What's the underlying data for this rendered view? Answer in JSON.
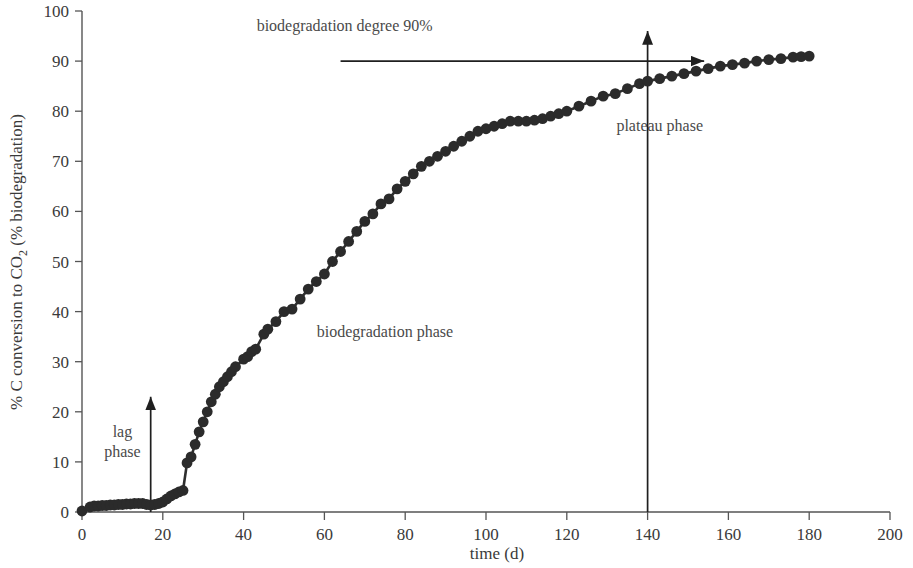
{
  "chart_data": {
    "type": "line",
    "title": "",
    "xlabel": "time (d)",
    "ylabel": "% C conversion to CO2 (% biodegradation)",
    "ylabel_parts": {
      "pre": "% C conversion to CO",
      "sub": "2",
      "post": " (% biodegradation)"
    },
    "xlim": [
      0,
      200
    ],
    "ylim": [
      0,
      100
    ],
    "xticks": [
      0,
      20,
      40,
      60,
      80,
      100,
      120,
      140,
      160,
      180,
      200
    ],
    "yticks": [
      0,
      10,
      20,
      30,
      40,
      50,
      60,
      70,
      80,
      90,
      100
    ],
    "grid": false,
    "legend": null,
    "marker": "filled-circle",
    "series": [
      {
        "name": "biodegradation curve",
        "x": [
          0,
          2,
          3,
          4,
          5,
          6,
          7,
          8,
          9,
          10,
          11,
          12,
          13,
          14,
          15,
          16,
          17,
          18,
          19,
          20,
          21,
          22,
          23,
          24,
          25,
          26,
          27,
          28,
          29,
          30,
          31,
          32,
          33,
          34,
          35,
          36,
          37,
          38,
          40,
          41,
          42,
          43,
          45,
          46,
          48,
          50,
          52,
          54,
          56,
          58,
          60,
          62,
          64,
          66,
          68,
          70,
          72,
          74,
          76,
          78,
          80,
          82,
          84,
          86,
          88,
          90,
          92,
          94,
          96,
          98,
          100,
          102,
          104,
          106,
          108,
          110,
          112,
          114,
          116,
          118,
          120,
          123,
          126,
          129,
          132,
          135,
          138,
          140,
          143,
          146,
          149,
          152,
          155,
          158,
          161,
          164,
          167,
          170,
          173,
          176,
          178,
          180
        ],
        "y": [
          0.2,
          1.0,
          1.2,
          1.2,
          1.3,
          1.3,
          1.4,
          1.4,
          1.5,
          1.5,
          1.6,
          1.6,
          1.7,
          1.7,
          1.7,
          1.5,
          1.4,
          1.5,
          1.7,
          2.0,
          2.6,
          3.2,
          3.6,
          4.0,
          4.3,
          9.8,
          11.0,
          13.5,
          16.0,
          18.0,
          20.0,
          22.0,
          23.5,
          25.0,
          26.0,
          27.0,
          28.0,
          29.0,
          30.5,
          31.0,
          32.0,
          32.5,
          35.5,
          36.5,
          38.0,
          40.0,
          40.5,
          42.5,
          44.5,
          46.0,
          47.5,
          50.0,
          52.0,
          54.0,
          56.0,
          58.0,
          59.5,
          61.5,
          62.5,
          64.5,
          66.0,
          67.5,
          69.0,
          70.0,
          71.0,
          72.0,
          73.0,
          74.0,
          75.0,
          76.0,
          76.5,
          77.0,
          77.5,
          78.0,
          78.0,
          78.0,
          78.2,
          78.5,
          79.0,
          79.5,
          80.0,
          81.0,
          82.0,
          83.0,
          83.5,
          84.5,
          85.5,
          86.0,
          86.5,
          87.0,
          87.5,
          88.0,
          88.5,
          89.0,
          89.3,
          89.6,
          90.0,
          90.3,
          90.5,
          90.8,
          90.9,
          91.0
        ]
      }
    ],
    "annotations": [
      {
        "id": "biodeg-degree",
        "text": "biodegradation degree 90%",
        "x": 65,
        "y": 96,
        "kind": "text"
      },
      {
        "id": "lag-phase",
        "text": "lag phase",
        "lines": [
          "lag",
          "phase"
        ],
        "x": 10,
        "y": 15,
        "kind": "text"
      },
      {
        "id": "biodeg-phase",
        "text": "biodegradation phase",
        "x": 75,
        "y": 35,
        "kind": "text"
      },
      {
        "id": "plateau-phase",
        "text": "plateau phase",
        "x": 143,
        "y": 76,
        "kind": "text"
      },
      {
        "id": "level-90-arrow",
        "kind": "h-arrow",
        "x_start": 64,
        "x_end": 154,
        "y": 90
      },
      {
        "id": "lag-phase-arrow",
        "kind": "v-arrow",
        "x": 17,
        "y_start": 0,
        "y_end": 23
      },
      {
        "id": "plateau-arrow",
        "kind": "v-arrow",
        "x": 140,
        "y_start": 0,
        "y_end": 96
      }
    ],
    "colors": {
      "line": "#2e2e2e",
      "marker": "#2b2b2b",
      "axis": "#555555",
      "text": "#3a3a3a",
      "annotation": "#4a4a4a"
    }
  }
}
